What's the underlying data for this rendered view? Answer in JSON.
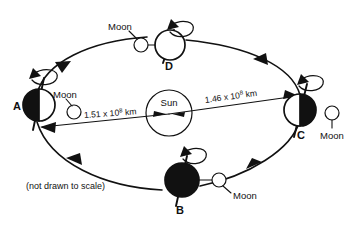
{
  "diagram": {
    "note": "(not drawn to scale)",
    "center_body": {
      "name": "Sun",
      "label": "Sun"
    },
    "positions": [
      {
        "id": "A",
        "label": "A",
        "earth_shading": "left-half-black",
        "moon_label": "Moon",
        "spin_arrow": "counterclockwise"
      },
      {
        "id": "B",
        "label": "B",
        "earth_shading": "full-black",
        "moon_label": "Moon",
        "spin_arrow": "counterclockwise"
      },
      {
        "id": "C",
        "label": "C",
        "earth_shading": "right-half-black",
        "moon_label": "Moon",
        "spin_arrow": "counterclockwise"
      },
      {
        "id": "D",
        "label": "D",
        "earth_shading": "full-white",
        "moon_label": "Moon",
        "spin_arrow": "counterclockwise"
      }
    ],
    "distances": [
      {
        "id": "left",
        "from": "A",
        "to": "Sun",
        "mantissa": "1.51 x 10",
        "exponent": "8",
        "unit": " km",
        "full_text": "1.51 x 10⁸ km"
      },
      {
        "id": "right",
        "from": "Sun",
        "to": "C",
        "mantissa": "1.46 x 10",
        "exponent": "8",
        "unit": " km",
        "full_text": "1.46 x 10⁸ km"
      }
    ],
    "orbit_direction": "counterclockwise",
    "colors": {
      "ink": "#111111",
      "background": "#ffffff",
      "shadow_fill": "#111111",
      "lit_fill": "#ffffff"
    }
  }
}
